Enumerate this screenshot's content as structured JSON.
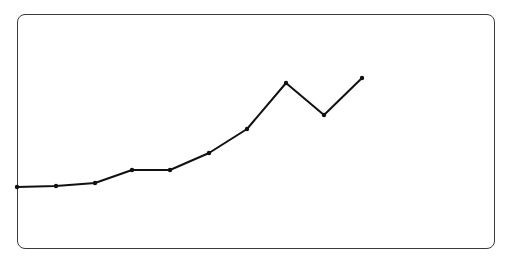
{
  "chart_data": {
    "type": "line",
    "title": "",
    "xlabel": "",
    "ylabel": "",
    "grid": false,
    "legend": null,
    "x": [
      1,
      2,
      3,
      4,
      5,
      6,
      7,
      8,
      9,
      10
    ],
    "series": [
      {
        "name": "series-1",
        "color": "#111111",
        "values": [
          10,
          11,
          13,
          25,
          25,
          40,
          62,
          104,
          75,
          109
        ]
      }
    ],
    "ylim": [
      0,
      160
    ],
    "pixel_points": [
      [
        17,
        187
      ],
      [
        56,
        186
      ],
      [
        95,
        183
      ],
      [
        132,
        170
      ],
      [
        170,
        170
      ],
      [
        209,
        153
      ],
      [
        247,
        129
      ],
      [
        286,
        83
      ],
      [
        324,
        115
      ],
      [
        362,
        78
      ]
    ]
  },
  "style": {
    "frame_color": "#3a3a3a",
    "line_color": "#111111",
    "background": "#ffffff"
  }
}
